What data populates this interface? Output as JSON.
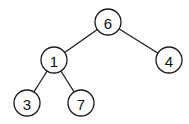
{
  "diagram": {
    "type": "binary-tree",
    "nodes": [
      {
        "id": "n6",
        "label": "6",
        "x": 108,
        "y": 22
      },
      {
        "id": "n1",
        "label": "1",
        "x": 54,
        "y": 60
      },
      {
        "id": "n4",
        "label": "4",
        "x": 169,
        "y": 60
      },
      {
        "id": "n3",
        "label": "3",
        "x": 27,
        "y": 103
      },
      {
        "id": "n7",
        "label": "7",
        "x": 81,
        "y": 103
      }
    ],
    "edges": [
      {
        "from": "n6",
        "to": "n1"
      },
      {
        "from": "n6",
        "to": "n4"
      },
      {
        "from": "n1",
        "to": "n3"
      },
      {
        "from": "n1",
        "to": "n7"
      }
    ],
    "node_radius": 13,
    "colors": {
      "stroke": "#1a1a1a",
      "fill": "#ffffff",
      "text": "#111111"
    }
  }
}
